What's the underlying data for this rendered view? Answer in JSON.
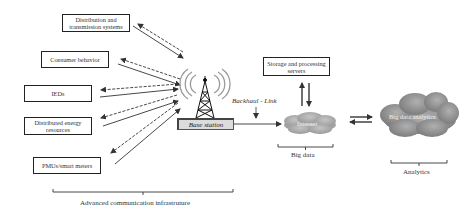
{
  "nodes": {
    "distribution": "Distribution and transmission systems",
    "consumer": "Consumer behavior",
    "ieds": "IEDs",
    "der": "Distributed energy resources",
    "pmu": "PMUs/smart meters",
    "storage": "Storage and processing servers",
    "base_station": "Base station",
    "internet": "Internet",
    "analytics_cloud": "Big data analytics"
  },
  "labels": {
    "backhaul": "Backhaul - Link",
    "big_data": "Big data",
    "analytics": "Analytics",
    "aci": "Advanced communication infrastruture"
  },
  "icons": {
    "tower": "cell-tower-icon",
    "internet_cloud": "cloud-icon",
    "analytics_cloud": "cloud-icon"
  },
  "colors": {
    "line": "#333333",
    "internet_cloud": "#a9a9a9",
    "analytics_cloud": "#8f8f8f",
    "base_station_fill": "#dcdcdc"
  }
}
